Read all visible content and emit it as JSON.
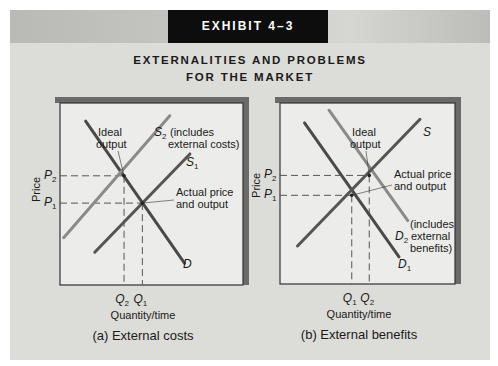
{
  "exhibit": "EXHIBIT 4–3",
  "title_lines": [
    "EXTERNALITIES AND PROBLEMS",
    "FOR THE MARKET"
  ],
  "colors": {
    "demand_line": "#4a4a4a",
    "supply_line": "#555555",
    "shifted_line": "#8a8a8a",
    "panel_bg": "#dcdcd8",
    "plot_bg": "#ececea",
    "shadow": "#6a6a6a"
  },
  "chart_data": [
    {
      "type": "line",
      "id": "a",
      "caption": "(a) External costs",
      "xlabel": "Quantity/time",
      "ylabel": "Price",
      "xlim": [
        0,
        10
      ],
      "ylim": [
        0,
        10
      ],
      "grid": false,
      "series": [
        {
          "name": "D",
          "label": "D",
          "style": "demand",
          "points": [
            [
              1.4,
              9.0
            ],
            [
              6.8,
              1.2
            ]
          ]
        },
        {
          "name": "S2",
          "label": "S₂ (includes external costs)",
          "style": "shifted",
          "points": [
            [
              0.2,
              2.6
            ],
            [
              6.0,
              9.3
            ]
          ]
        },
        {
          "name": "S1",
          "label": "S₁",
          "style": "supply",
          "points": [
            [
              1.9,
              1.8
            ],
            [
              7.1,
              7.2
            ]
          ]
        }
      ],
      "points": [
        {
          "name": "ideal",
          "x": 3.5,
          "y": 6.0,
          "annotation": "Ideal output"
        },
        {
          "name": "actual",
          "x": 4.5,
          "y": 4.5,
          "annotation": "Actual price and output"
        }
      ],
      "x_ticks": [
        {
          "label": "Q2",
          "main": "Q",
          "sub": "2",
          "x": 3.5
        },
        {
          "label": "Q1",
          "main": "Q",
          "sub": "1",
          "x": 4.5
        }
      ],
      "y_ticks": [
        {
          "label": "P2",
          "main": "P",
          "sub": "2",
          "y": 6.0
        },
        {
          "label": "P1",
          "main": "P",
          "sub": "1",
          "y": 4.5
        }
      ],
      "annotations": {
        "ideal": [
          "Ideal",
          "output"
        ],
        "actual": [
          "Actual price",
          "and output"
        ],
        "s2_main": "S",
        "s2_sub": "2",
        "s2_text": [
          "(includes",
          "external costs)"
        ],
        "s1_main": "S",
        "s1_sub": "1",
        "d_main": "D",
        "d_sub": ""
      }
    },
    {
      "type": "line",
      "id": "b",
      "caption": "(b) External benefits",
      "xlabel": "Quantity/time",
      "ylabel": "Price",
      "xlim": [
        0,
        10
      ],
      "ylim": [
        0,
        10
      ],
      "grid": false,
      "series": [
        {
          "name": "D1",
          "label": "D₁",
          "style": "demand",
          "points": [
            [
              1.4,
              8.9
            ],
            [
              6.8,
              1.5
            ]
          ]
        },
        {
          "name": "D2",
          "label": "D₂ (includes external benefits)",
          "style": "shifted",
          "points": [
            [
              2.8,
              9.6
            ],
            [
              7.3,
              3.5
            ]
          ]
        },
        {
          "name": "S",
          "label": "S",
          "style": "supply",
          "points": [
            [
              1.0,
              2.1
            ],
            [
              8.0,
              9.1
            ]
          ]
        }
      ],
      "points": [
        {
          "name": "ideal",
          "x": 5.1,
          "y": 6.0,
          "annotation": "Ideal output"
        },
        {
          "name": "actual",
          "x": 4.1,
          "y": 4.9,
          "annotation": "Actual price and output"
        }
      ],
      "x_ticks": [
        {
          "label": "Q1",
          "main": "Q",
          "sub": "1",
          "x": 4.1
        },
        {
          "label": "Q2",
          "main": "Q",
          "sub": "2",
          "x": 5.1
        }
      ],
      "y_ticks": [
        {
          "label": "P2",
          "main": "P",
          "sub": "2",
          "y": 6.0
        },
        {
          "label": "P1",
          "main": "P",
          "sub": "1",
          "y": 4.9
        }
      ],
      "annotations": {
        "ideal": [
          "Ideal",
          "output"
        ],
        "actual": [
          "Actual price",
          "and output"
        ],
        "d2_main": "D",
        "d2_sub": "2",
        "d2_text": [
          "(includes",
          "external",
          "benefits)"
        ],
        "d1_main": "D",
        "d1_sub": "1",
        "s_main": "S",
        "s_sub": ""
      }
    }
  ]
}
